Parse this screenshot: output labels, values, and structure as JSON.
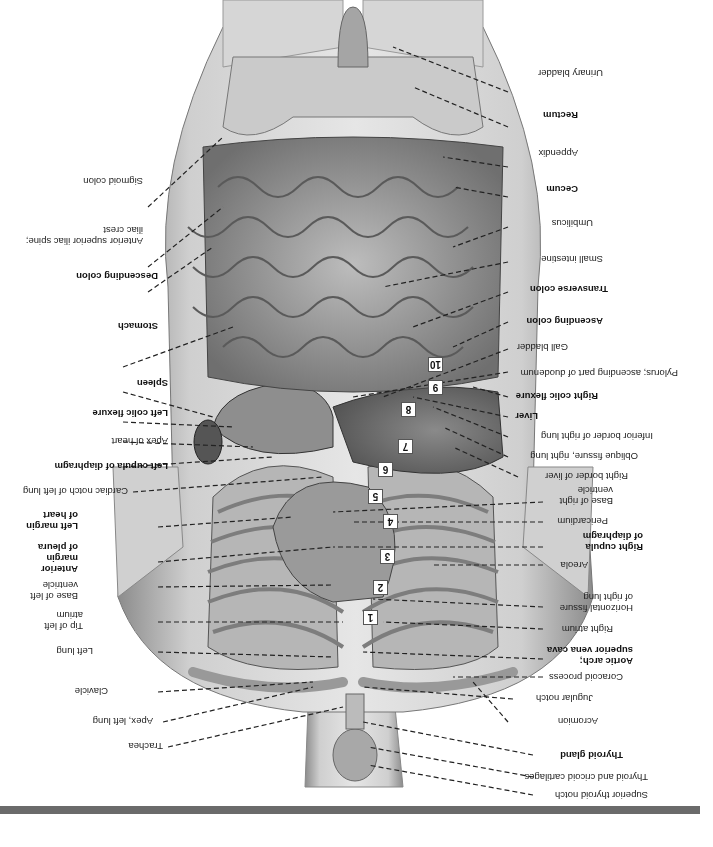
{
  "figure": {
    "orientation": "rotated 180 degrees",
    "artist_signature": "signature mark"
  },
  "labels_right_side_upright": [
    {
      "text": "Superior thyroid notch",
      "bold": false
    },
    {
      "text": "Thyroid and cricoid cartilages",
      "bold": false
    },
    {
      "text": "Thyroid gland",
      "bold": true
    },
    {
      "text": "Acromion",
      "bold": false
    },
    {
      "text": "Jugular notch",
      "bold": false
    },
    {
      "text": "Coracoid process",
      "bold": false
    },
    {
      "text": "Aortic arch;",
      "bold": true
    },
    {
      "text": "superior vena cava",
      "bold": true
    },
    {
      "text": "Right atrium",
      "bold": false
    },
    {
      "text": "Horizontal fissure",
      "bold": false
    },
    {
      "text": "of right lung",
      "bold": false
    },
    {
      "text": "Areola",
      "bold": false
    },
    {
      "text": "Right cupula",
      "bold": true
    },
    {
      "text": "of diaphragm",
      "bold": true
    },
    {
      "text": "Pericardium",
      "bold": false
    },
    {
      "text": "Base of right",
      "bold": false
    },
    {
      "text": "ventricle",
      "bold": false
    },
    {
      "text": "Right border of liver",
      "bold": false
    },
    {
      "text": "Oblique fissure, right lung",
      "bold": false
    },
    {
      "text": "Inferior border of right lung",
      "bold": false
    },
    {
      "text": "Liver",
      "bold": true
    },
    {
      "text": "Right colic flexure",
      "bold": true
    },
    {
      "text": "Pylorus; ascending part of duodenum",
      "bold": false
    },
    {
      "text": "Gall bladder",
      "bold": false
    },
    {
      "text": "Ascending colon",
      "bold": true
    },
    {
      "text": "Transverse colon",
      "bold": true
    },
    {
      "text": "Small intestine",
      "bold": false
    },
    {
      "text": "Umbilicus",
      "bold": false
    },
    {
      "text": "Cecum",
      "bold": true
    },
    {
      "text": "Appendix",
      "bold": false
    },
    {
      "text": "Rectum",
      "bold": true
    },
    {
      "text": "Urinary bladder",
      "bold": false
    }
  ],
  "labels_left_side_upright": [
    {
      "text": "Trachea",
      "bold": false
    },
    {
      "text": "Apex, left lung",
      "bold": false
    },
    {
      "text": "Clavicle",
      "bold": false
    },
    {
      "text": "Left lung",
      "bold": false
    },
    {
      "text": "Tip of left",
      "bold": false
    },
    {
      "text": "atrium",
      "bold": false
    },
    {
      "text": "Base of left",
      "bold": false
    },
    {
      "text": "ventricle",
      "bold": false
    },
    {
      "text": "Anterior",
      "bold": true
    },
    {
      "text": "margin",
      "bold": true
    },
    {
      "text": "of pleura",
      "bold": true
    },
    {
      "text": "Left margin",
      "bold": true
    },
    {
      "text": "of heart",
      "bold": true
    },
    {
      "text": "Cardiac notch of left lung",
      "bold": false
    },
    {
      "text": "Left cupula of diaphragm",
      "bold": true
    },
    {
      "text": "Apex of heart",
      "bold": false
    },
    {
      "text": "Left colic flexure",
      "bold": true
    },
    {
      "text": "Spleen",
      "bold": true
    },
    {
      "text": "Stomach",
      "bold": true
    },
    {
      "text": "Descending colon",
      "bold": true
    },
    {
      "text": "Anterior superior iliac spine;",
      "bold": false
    },
    {
      "text": "iliac crest",
      "bold": false
    },
    {
      "text": "Sigmoid colon",
      "bold": false
    }
  ],
  "rib_numbers": [
    "1",
    "2",
    "3",
    "4",
    "5",
    "6",
    "7",
    "8",
    "9",
    "10"
  ],
  "colors": {
    "bottom_bar": "#6b6b6b",
    "skin_light": "#d8d8d8",
    "skin_dark": "#8a8a8a",
    "organ_mid": "#9a9a9a",
    "organ_dark": "#5e5e5e",
    "leader_line": "#222222"
  }
}
